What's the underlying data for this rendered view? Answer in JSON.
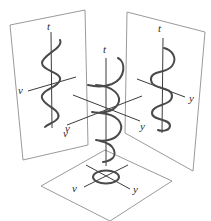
{
  "figure": {
    "colors": {
      "panel_border": "#9a9a9a",
      "axis": "#3c3c3c",
      "curve": "#4a4a4a",
      "background": "#ffffff"
    }
  },
  "left_panel": {
    "name": "t-v projection",
    "labels": {
      "t": "t",
      "v_left": "v",
      "v_bottom": "v"
    }
  },
  "right_panel": {
    "name": "t-y projection",
    "labels": {
      "t": "t",
      "y": "y"
    }
  },
  "center": {
    "name": "3D helix",
    "labels": {
      "t": "t",
      "v": "v",
      "y": "y"
    }
  },
  "bottom_panel": {
    "name": "v-y projection (circle)",
    "labels": {
      "v": "v",
      "y": "y"
    }
  }
}
